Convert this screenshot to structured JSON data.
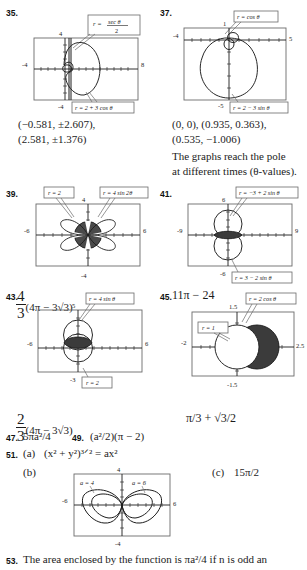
{
  "page": {
    "background": "#ffffff",
    "ink": "#1c1c1c",
    "shade": "#4a4a4a",
    "box_stroke": "#5a5a5a"
  },
  "problems": [
    {
      "number": "35.",
      "graph": {
        "x_left_label": "-4",
        "x_right_label": "8",
        "y_top_label": "4",
        "y_bottom_label": "-4",
        "callouts": [
          {
            "id": "sec-theta-over-2",
            "text_parts": {
              "lhs": "r =",
              "num": "sec θ",
              "den": "2"
            }
          },
          {
            "id": "limacon",
            "text": "r = 2 + 3 cos θ"
          }
        ]
      },
      "answer_lines": [
        "(−0.581, ±2.607),",
        "(2.581, ±1.376)"
      ]
    },
    {
      "number": "37.",
      "graph": {
        "x_left_label": "-4",
        "x_right_label": "5",
        "y_top_label": "1",
        "y_bottom_label": "-5",
        "callouts": [
          {
            "id": "cos-circle",
            "text": "r = cos θ"
          },
          {
            "id": "limacon-sin",
            "text": "r = 2 − 3 sin θ"
          }
        ]
      },
      "answer_lines": [
        "(0, 0), (0.935, 0.363),",
        "(0.535, −1.006)",
        "The graphs reach the pole",
        "at different times (θ-values)."
      ]
    },
    {
      "number": "39.",
      "graph": {
        "x_left_label": "-6",
        "x_right_label": "6",
        "y_top_label": "4",
        "y_bottom_label": "-4",
        "callouts": [
          {
            "id": "circle-r2",
            "text": "r = 2"
          },
          {
            "id": "rose",
            "text": "r = 4 sin 2θ"
          }
        ]
      },
      "answer_expr": {
        "frac_num": "4",
        "frac_den": "3",
        "body": "(4π − 3√3)"
      }
    },
    {
      "number": "41.",
      "graph": {
        "x_left_label": "-9",
        "x_right_label": "9",
        "y_top_label": "6",
        "y_bottom_label": "-6",
        "callouts": [
          {
            "id": "limacon-neg",
            "text": "r = −3 + 2 sin θ"
          },
          {
            "id": "limacon-pos",
            "text": "r = 3 − 2 sin θ"
          }
        ]
      },
      "answer_text": "11π − 24"
    },
    {
      "number": "43.",
      "graph": {
        "x_left_label": "-6",
        "x_right_label": "6",
        "y_top_label": "5",
        "y_bottom_label": "-3",
        "callouts": [
          {
            "id": "four-sin",
            "text": "r = 4 sin θ"
          },
          {
            "id": "circle-r2",
            "text": "r = 2"
          }
        ]
      },
      "answer_expr": {
        "frac_num": "2",
        "frac_den": "3",
        "body": "(4π − 3√3)"
      }
    },
    {
      "number": "45.",
      "graph": {
        "x_left_label": "-2",
        "x_right_label": "2.5",
        "y_top_label": "1.5",
        "y_bottom_label": "-1.5",
        "callouts": [
          {
            "id": "circle-r1",
            "text": "r = 1"
          },
          {
            "id": "two-cos",
            "text": "r = 2 cos θ"
          }
        ]
      },
      "answer_text": "π/3 + √3/2"
    }
  ],
  "answers_47_49": {
    "n47": "47.",
    "a47": "5πa²/4",
    "n49": "49.",
    "a49": "(a²/2)(π − 2)"
  },
  "problem51": {
    "number": "51.",
    "part_a_label": "(a)",
    "part_a_expr": "(x² + y²)³ᐟ² = ax²",
    "part_b_label": "(b)",
    "part_c_label": "(c)",
    "part_c_expr": "15π/2",
    "graph": {
      "x_left_label": "-6",
      "x_right_label": "6",
      "y_top_label": "4",
      "y_bottom_label": "-4",
      "callouts": [
        {
          "id": "a4",
          "text": "a = 4"
        },
        {
          "id": "a6",
          "text": "a = 6"
        }
      ]
    }
  },
  "problem53": {
    "number": "53.",
    "text": "The area enclosed by the function is πa²/4 if n is odd an"
  }
}
